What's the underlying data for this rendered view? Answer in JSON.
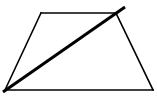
{
  "diagram": {
    "type": "geometry",
    "shapes": [
      {
        "name": "trapezoid",
        "kind": "quadrilateral",
        "vertices": [
          "top-left",
          "top-right",
          "bottom-right",
          "bottom-left"
        ]
      },
      {
        "name": "diagonal-line",
        "kind": "line",
        "from": "bottom-left",
        "through": "top-right",
        "extends_beyond": "top-right"
      }
    ],
    "stroke_color": "#000000",
    "background_color": "#ffffff",
    "labels": []
  }
}
